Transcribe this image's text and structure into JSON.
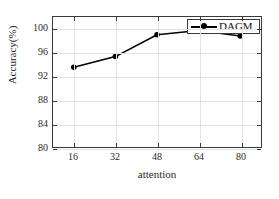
{
  "chart_data": {
    "type": "line",
    "title": "",
    "xlabel": "attention",
    "ylabel": "Accuracy(%)",
    "x": [
      16,
      32,
      48,
      64,
      80
    ],
    "xticks": [
      "16",
      "32",
      "48",
      "64",
      "80"
    ],
    "yticks": [
      "80",
      "84",
      "88",
      "92",
      "96",
      "100"
    ],
    "xlim": [
      8,
      88
    ],
    "ylim": [
      80,
      102
    ],
    "grid": true,
    "legend_position": "top-right",
    "series": [
      {
        "name": "DAGM",
        "color": "#000000",
        "marker": "circle",
        "values": [
          93.5,
          95.3,
          99.0,
          99.7,
          98.8
        ]
      }
    ]
  },
  "legend": {
    "entries": [
      {
        "label": "DAGM"
      }
    ]
  },
  "axes": {
    "x_title": "attention",
    "y_title": "Accuracy(%)"
  }
}
